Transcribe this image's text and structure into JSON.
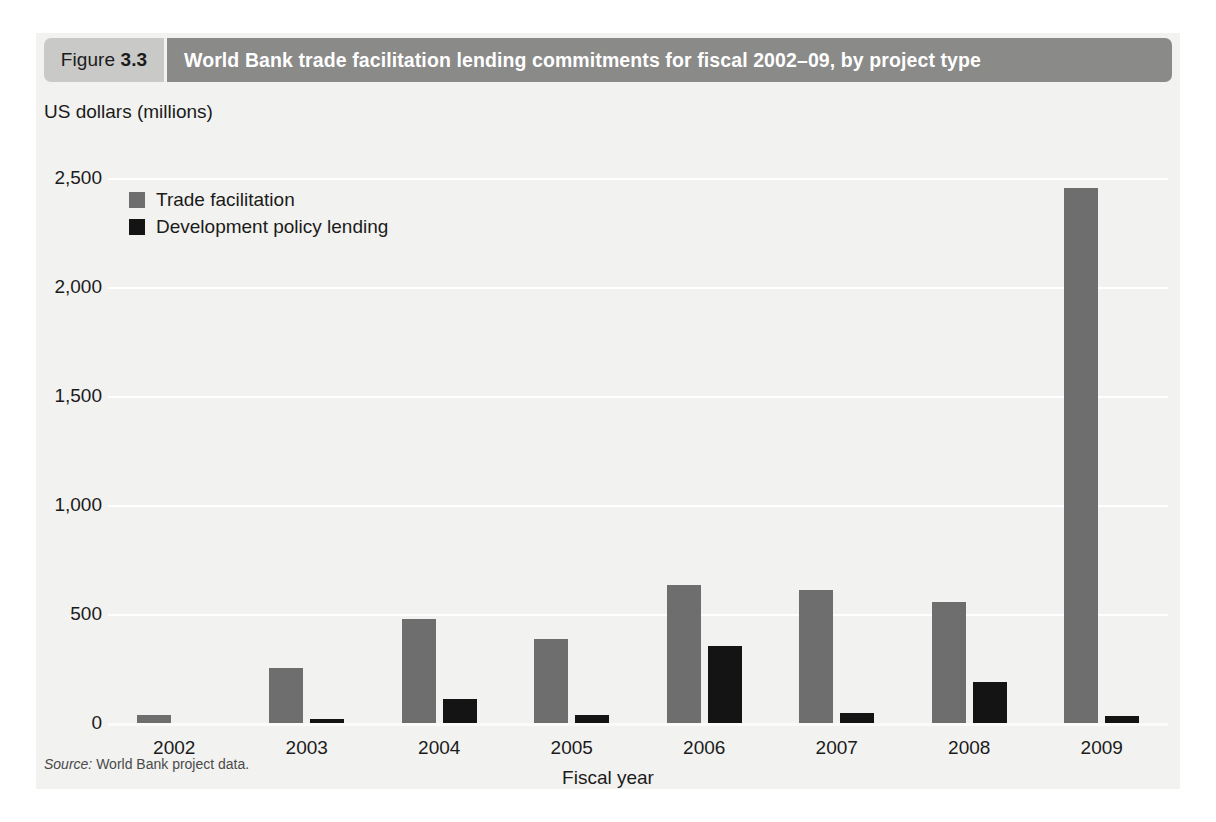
{
  "figure": {
    "number_prefix": "Figure",
    "number": "3.3",
    "title": "World Bank trade facilitation lending commitments for fiscal 2002–09, by project type",
    "source_word": "Source:",
    "source_text": "World Bank project data."
  },
  "colors": {
    "trade_facilitation": "#6e6e6e",
    "development_policy_lending": "#141414",
    "panel_background": "#f2f2f0",
    "title_bar": "#8a8a88",
    "figure_box": "#c9c9c7",
    "gridline": "#ffffff"
  },
  "chart_data": {
    "type": "bar",
    "title": "World Bank trade facilitation lending commitments for fiscal 2002–09, by project type",
    "subtitle": "",
    "ylabel": "US dollars (millions)",
    "xlabel": "Fiscal year",
    "categories": [
      "2002",
      "2003",
      "2004",
      "2005",
      "2006",
      "2007",
      "2008",
      "2009"
    ],
    "series": [
      {
        "name": "Trade facilitation",
        "color": "#6e6e6e",
        "values": [
          38,
          253,
          476,
          386,
          633,
          610,
          557,
          2452
        ]
      },
      {
        "name": "Development policy lending",
        "color": "#141414",
        "values": [
          0,
          18,
          110,
          38,
          352,
          48,
          190,
          33
        ]
      }
    ],
    "ylim": [
      0,
      2500
    ],
    "yticks": [
      0,
      500,
      1000,
      1500,
      2000,
      2500
    ],
    "ytick_labels": [
      "0",
      "500",
      "1,000",
      "1,500",
      "2,000",
      "2,500"
    ],
    "grid": true,
    "legend_position": "top-left"
  }
}
